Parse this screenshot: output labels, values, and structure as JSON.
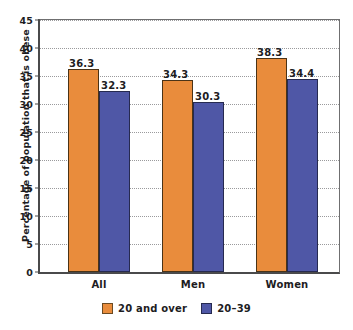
{
  "chart_data": {
    "type": "bar",
    "title": "",
    "xlabel": "",
    "ylabel": "Percentage of population that is obese",
    "categories": [
      "All",
      "Men",
      "Women"
    ],
    "series": [
      {
        "name": "20 and over",
        "color": "#e98c3c",
        "values": [
          36.3,
          34.3,
          38.3
        ]
      },
      {
        "name": "20–39",
        "color": "#4f57a6",
        "values": [
          32.3,
          30.3,
          34.4
        ]
      }
    ],
    "value_labels": [
      [
        "36.3",
        "32.3"
      ],
      [
        "34.3",
        "30.3"
      ],
      [
        "38.3",
        "34.4"
      ]
    ],
    "ylim": [
      0,
      45
    ],
    "ytick_values": [
      0,
      5,
      10,
      15,
      20,
      25,
      30,
      35,
      40,
      45
    ],
    "ytick_labels": [
      "0",
      "5",
      "10",
      "15",
      "20",
      "25",
      "30",
      "35",
      "40",
      "45"
    ],
    "grid": true,
    "grid_style": "dotted",
    "grid_color": "#9a9a9c",
    "legend_position": "bottom",
    "legend_entries": [
      "20 and over",
      "20–39"
    ],
    "background_color": "#ffffff",
    "frame_color": "#4a4a4b"
  }
}
